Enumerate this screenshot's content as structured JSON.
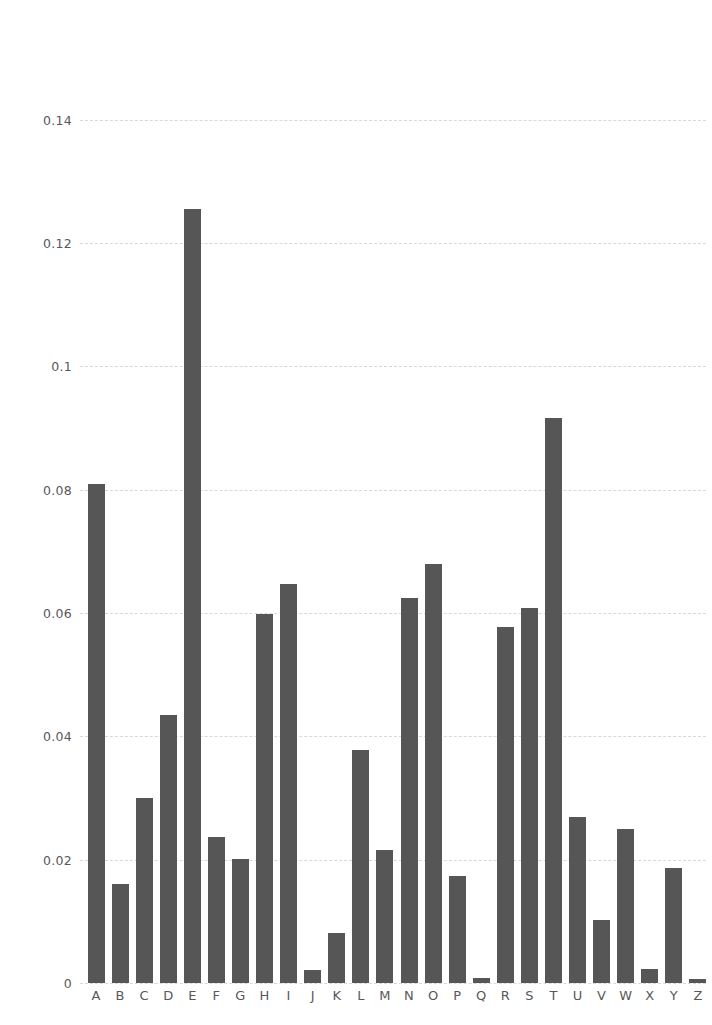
{
  "chart_data": {
    "type": "bar",
    "title": "",
    "subtitle": "",
    "xlabel": "",
    "ylabel": "",
    "categories": [
      "A",
      "B",
      "C",
      "D",
      "E",
      "F",
      "G",
      "H",
      "I",
      "J",
      "K",
      "L",
      "M",
      "N",
      "O",
      "P",
      "Q",
      "R",
      "S",
      "T",
      "U",
      "V",
      "W",
      "X",
      "Y",
      "Z"
    ],
    "values": [
      0.0812,
      0.0149,
      0.0271,
      0.0432,
      0.1261,
      0.023,
      0.0203,
      0.0592,
      0.0731,
      0.001,
      0.0069,
      0.0398,
      0.0261,
      0.0695,
      0.0768,
      0.0182,
      0.0011,
      0.0602,
      0.0628,
      0.091,
      0.0288,
      0.0111,
      0.0209,
      0.0017,
      0.0211,
      0.0007
    ],
    "bar_values_rendered": [
      0.081,
      0.0161,
      0.03,
      0.0435,
      0.1255,
      0.0236,
      0.0201,
      0.0599,
      0.0647,
      0.0021,
      0.0081,
      0.0378,
      0.0216,
      0.0625,
      0.068,
      0.0173,
      0.0008,
      0.0577,
      0.0608,
      0.0916,
      0.027,
      0.0102,
      0.025,
      0.0023,
      0.0187,
      0.0007
    ],
    "ylim": [
      0,
      0.1445
    ],
    "ytick_values": [
      0,
      0.02,
      0.04,
      0.06,
      0.08,
      0.1,
      0.12,
      0.14
    ],
    "ytick_labels": [
      "0",
      "0.02",
      "0.04",
      "0.06",
      "0.08",
      "0.1",
      "0.12",
      "0.14"
    ],
    "grid": true,
    "grid_axis": "y",
    "grid_style": "dashed",
    "legend": false,
    "legend_position": "none",
    "bar_color": "#565656",
    "grid_color": "#d8d8d8",
    "tick_label_color": "#58585a",
    "background_color": "#ffffff"
  },
  "axes": {
    "y": {
      "ticks": [
        {
          "label": "0.14",
          "value": 0.14
        },
        {
          "label": "0.12",
          "value": 0.12
        },
        {
          "label": "0.1",
          "value": 0.1
        },
        {
          "label": "0.08",
          "value": 0.08
        },
        {
          "label": "0.06",
          "value": 0.06
        },
        {
          "label": "0.04",
          "value": 0.04
        },
        {
          "label": "0.02",
          "value": 0.02
        },
        {
          "label": "0",
          "value": 0
        }
      ]
    },
    "x": {
      "ticks": [
        {
          "label": "A"
        },
        {
          "label": "B"
        },
        {
          "label": "C"
        },
        {
          "label": "D"
        },
        {
          "label": "E"
        },
        {
          "label": "F"
        },
        {
          "label": "G"
        },
        {
          "label": "H"
        },
        {
          "label": "I"
        },
        {
          "label": "J"
        },
        {
          "label": "K"
        },
        {
          "label": "L"
        },
        {
          "label": "M"
        },
        {
          "label": "N"
        },
        {
          "label": "O"
        },
        {
          "label": "P"
        },
        {
          "label": "Q"
        },
        {
          "label": "R"
        },
        {
          "label": "S"
        },
        {
          "label": "T"
        },
        {
          "label": "U"
        },
        {
          "label": "V"
        },
        {
          "label": "W"
        },
        {
          "label": "X"
        },
        {
          "label": "Y"
        },
        {
          "label": "Z"
        }
      ]
    }
  }
}
